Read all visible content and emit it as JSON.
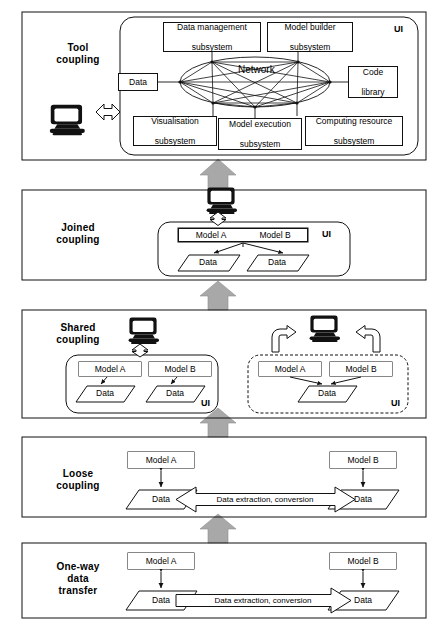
{
  "figure": {
    "background": "#ffffff",
    "line_color": "#111111",
    "gray_arrow_color": "#a6a6a6"
  },
  "panels": [
    {
      "id": "tool",
      "label": "Tool\ncoupling",
      "label_line1": "Tool",
      "label_line2": "coupling",
      "ui_label": "UI",
      "nodes": [
        {
          "name": "data-management-subsystem",
          "line1": "Data management",
          "line2": "subsystem"
        },
        {
          "name": "model-builder-subsystem",
          "line1": "Model  builder",
          "line2": "subsystem"
        },
        {
          "name": "data-node",
          "line1": "Data",
          "line2": ""
        },
        {
          "name": "code-library",
          "line1": "Code",
          "line2": "library"
        },
        {
          "name": "visualisation-subsystem",
          "line1": "Visualisation",
          "line2": "subsystem"
        },
        {
          "name": "model-execution-subsystem",
          "line1": "Model execution",
          "line2": "subsystem"
        },
        {
          "name": "computing-resource-subsystem",
          "line1": "Computing resource",
          "line2": "subsystem"
        }
      ],
      "network_label": "Network"
    },
    {
      "id": "joined",
      "label_line1": "Joined",
      "label_line2": "coupling",
      "ui_label": "UI",
      "model_a": "Model A",
      "model_b": "Model B",
      "data_left": "Data",
      "data_right": "Data"
    },
    {
      "id": "shared",
      "label_line1": "Shared",
      "label_line2": "coupling",
      "ui_label_left": "UI",
      "ui_label_right": "UI",
      "left": {
        "model_a": "Model A",
        "model_b": "Model B",
        "data_a": "Data",
        "data_b": "Data"
      },
      "right": {
        "model_a": "Model A",
        "model_b": "Model B",
        "data_shared": "Data"
      }
    },
    {
      "id": "loose",
      "label_line1": "Loose",
      "label_line2": "coupling",
      "model_a": "Model A",
      "model_b": "Model B",
      "data_left": "Data",
      "data_right": "Data",
      "flow_label": "Data extraction, conversion",
      "flow_direction": "bidirectional"
    },
    {
      "id": "oneway",
      "label_line1": "One-way",
      "label_line2": "data",
      "label_line3": "transfer",
      "model_a": "Model A",
      "model_b": "Model B",
      "data_left": "Data",
      "data_right": "Data",
      "flow_label": "Data extraction, conversion",
      "flow_direction": "left-to-right"
    }
  ],
  "icons": {
    "computer": "computer-icon",
    "updown_arrow": "double-headed-vertical-arrow-icon",
    "leftright_arrow": "double-headed-horizontal-arrow-icon",
    "curved_arrow": "curved-arrow-icon",
    "gray_up_arrow": "gray-up-arrow-icon"
  },
  "gray_arrows_count": 4
}
